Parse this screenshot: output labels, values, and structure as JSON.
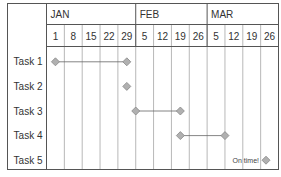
{
  "chart_data": {
    "type": "gantt",
    "title": "",
    "months": [
      {
        "label": "JAN",
        "span": 5
      },
      {
        "label": "FEB",
        "span": 4
      },
      {
        "label": "MAR",
        "span": 4
      }
    ],
    "weeks": [
      "1",
      "8",
      "15",
      "22",
      "29",
      "5",
      "12",
      "19",
      "26",
      "5",
      "12",
      "19",
      "26"
    ],
    "tasks": [
      {
        "label": "Task 1",
        "start_col": 0,
        "end_col": 4,
        "start": "JAN 1",
        "end": "JAN 29"
      },
      {
        "label": "Task 2",
        "start_col": 4,
        "end_col": 4,
        "start": "JAN 29",
        "end": "JAN 29"
      },
      {
        "label": "Task 3",
        "start_col": 4.5,
        "end_col": 7,
        "start": "FEB 1",
        "end": "FEB 19"
      },
      {
        "label": "Task 4",
        "start_col": 7,
        "end_col": 9.5,
        "start": "FEB 19",
        "end": "MAR 5"
      },
      {
        "label": "Task 5",
        "start_col": 11.8,
        "end_col": 11.8,
        "start": "MAR 24",
        "end": "MAR 24",
        "annotation": "On time!"
      }
    ],
    "annotations": [
      "On time!"
    ],
    "colors": {
      "grid": "#b8b8b8",
      "border": "#555555",
      "marker_fill": "#b0b0b0",
      "marker_stroke": "#888888",
      "line": "#666666"
    }
  }
}
